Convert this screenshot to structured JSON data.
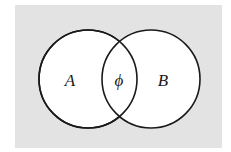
{
  "diagram": {
    "type": "venn",
    "background_color": "#e3e3e3",
    "circle_fill": "#ffffff",
    "stroke_color": "#1a1a1a",
    "sets": [
      {
        "id": "A",
        "label": "A",
        "cx": 88,
        "cy": 79,
        "r": 49
      },
      {
        "id": "B",
        "label": "B",
        "cx": 151,
        "cy": 79,
        "r": 49
      }
    ],
    "intersection": {
      "label": "ϕ",
      "meaning": "empty set"
    }
  }
}
